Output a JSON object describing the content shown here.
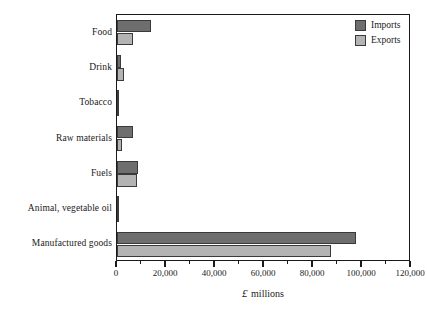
{
  "chart_data": {
    "type": "bar",
    "orientation": "horizontal",
    "title": "",
    "xlabel": "£ millions",
    "ylabel": "",
    "xlim": [
      0,
      120000
    ],
    "grid": false,
    "legend_position": "top-right",
    "categories": [
      "Food",
      "Drink",
      "Tobacco",
      "Raw materials",
      "Fuels",
      "Animal, vegetable oil",
      "Manufactured goods"
    ],
    "series": [
      {
        "name": "Imports",
        "color": "#6e6e6e",
        "values": [
          14000,
          1800,
          400,
          6500,
          8500,
          700,
          97500
        ]
      },
      {
        "name": "Exports",
        "color": "#b3b3b3",
        "values": [
          6500,
          3000,
          1000,
          2000,
          8000,
          400,
          87500
        ]
      }
    ],
    "xticks": [
      0,
      20000,
      40000,
      60000,
      80000,
      100000,
      120000
    ],
    "xticklabels": [
      "0",
      "20,000",
      "40,000",
      "60,000",
      "80,000",
      "100,000",
      "120,000"
    ],
    "xminor_ticks": [
      10000,
      30000,
      50000,
      70000,
      90000,
      110000
    ]
  },
  "axis": {
    "title_currency_symbol": "£",
    "title_text": " millions"
  },
  "legend": {
    "entries": [
      {
        "label": "Imports",
        "color": "#6e6e6e"
      },
      {
        "label": "Exports",
        "color": "#b3b3b3"
      }
    ]
  }
}
